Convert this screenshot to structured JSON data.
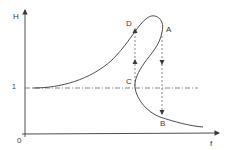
{
  "diagram": {
    "type": "frequency-response-jump-phenomenon",
    "axes": {
      "y_label": "H",
      "x_label": "f",
      "origin_label": "0",
      "reference_level_label": "1"
    },
    "points": {
      "A": "A",
      "B": "B",
      "C": "C",
      "D": "D"
    },
    "colors": {
      "line": "#3a3a3a",
      "background": "#ffffff"
    },
    "jumps": [
      {
        "from": "A",
        "to": "B",
        "direction": "down"
      },
      {
        "from": "C",
        "to": "D",
        "direction": "up"
      }
    ]
  }
}
